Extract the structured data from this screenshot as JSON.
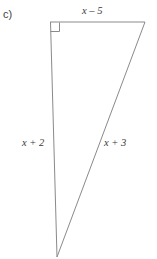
{
  "figure": {
    "part_label": "c)",
    "shape": "right-triangle",
    "stroke_color": "#8a8a8a",
    "text_color": "#3a3a3a",
    "background_color": "#ffffff",
    "right_angle_marker": {
      "present": true,
      "at_vertex": "top-left",
      "size_px": 9
    },
    "vertices": {
      "top_left": {
        "x": 50,
        "y": 22
      },
      "top_right": {
        "x": 145,
        "y": 22
      },
      "bottom": {
        "x": 57,
        "y": 257
      }
    },
    "sides": [
      {
        "name": "top-side",
        "label": "x – 5",
        "position": "top"
      },
      {
        "name": "left-side",
        "label": "x + 2",
        "position": "left"
      },
      {
        "name": "hypotenuse",
        "label": "x + 3",
        "position": "right"
      }
    ],
    "labels": {
      "top": "x – 5",
      "left": "x + 2",
      "hypotenuse": "x + 3"
    }
  }
}
